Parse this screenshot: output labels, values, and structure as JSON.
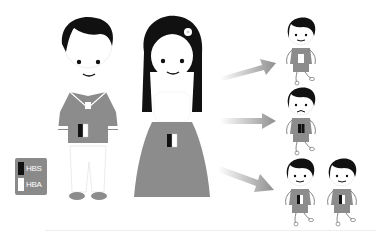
{
  "diagram": {
    "legend": {
      "items": [
        {
          "label": "HBS",
          "color": "#111111"
        },
        {
          "label": "HBA",
          "color": "#ffffff"
        }
      ],
      "background": "#8a8a8a"
    },
    "parents": [
      {
        "name": "father",
        "genotype": "HbS/HbA"
      },
      {
        "name": "mother",
        "genotype": "HbS/HbA"
      }
    ],
    "offspring": [
      {
        "row": 1,
        "genotype": "HbA/HbA",
        "count": 1,
        "expression": "smiling"
      },
      {
        "row": 2,
        "genotype": "HbS/HbS",
        "count": 1,
        "expression": "sad"
      },
      {
        "row": 3,
        "genotype": "HbS/HbA",
        "count": 2,
        "expression": "smiling"
      }
    ],
    "colors": {
      "clothing": "#8c8c8c",
      "hair": "#111111",
      "arrow": "#a0a0a0"
    }
  }
}
